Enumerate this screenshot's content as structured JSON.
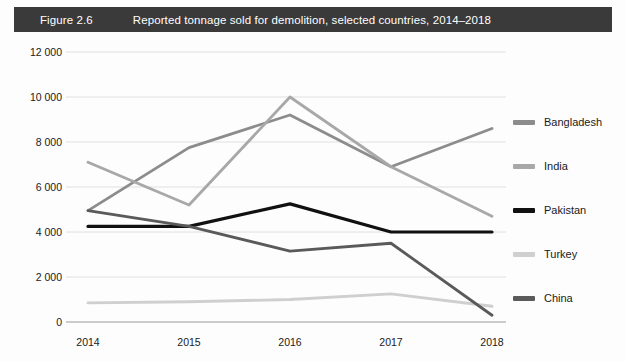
{
  "header": {
    "figure_number": "Figure 2.6",
    "title": "Reported tonnage sold for demolition, selected countries, 2014–2018",
    "banner_color": "#3a3a3a",
    "text_color": "#ffffff"
  },
  "chart_data": {
    "type": "line",
    "title": "Reported tonnage sold for demolition, selected countries, 2014–2018",
    "xlabel": "",
    "ylabel": "",
    "categories": [
      "2014",
      "2015",
      "2016",
      "2017",
      "2018"
    ],
    "x_tick_labels": [
      "2014",
      "2015",
      "2016",
      "2017",
      "2018"
    ],
    "y_tick_labels": [
      "12 000",
      "10 000",
      "8 000",
      "6 000",
      "4 000",
      "2 000",
      "0"
    ],
    "y_tick_values": [
      12000,
      10000,
      8000,
      6000,
      4000,
      2000,
      0
    ],
    "ylim": [
      0,
      12000
    ],
    "grid": true,
    "grid_axis": "y",
    "legend_position": "right",
    "series": [
      {
        "name": "Bangladesh",
        "color": "#8c8c8c",
        "values": [
          4950,
          7750,
          9200,
          6900,
          8600
        ]
      },
      {
        "name": "India",
        "color": "#a8a8a8",
        "values": [
          7100,
          5200,
          10000,
          6900,
          4700
        ]
      },
      {
        "name": "Pakistan",
        "color": "#111111",
        "values": [
          4250,
          4250,
          5250,
          4000,
          4000
        ]
      },
      {
        "name": "Turkey",
        "color": "#cfcfcf",
        "values": [
          850,
          900,
          1000,
          1250,
          700
        ]
      },
      {
        "name": "China",
        "color": "#5a5a5a",
        "values": [
          4950,
          4250,
          3150,
          3500,
          300
        ]
      }
    ]
  },
  "legend": {
    "items": [
      {
        "label": "Bangladesh",
        "color": "#8c8c8c"
      },
      {
        "label": "India",
        "color": "#a8a8a8"
      },
      {
        "label": "Pakistan",
        "color": "#111111"
      },
      {
        "label": "Turkey",
        "color": "#cfcfcf"
      },
      {
        "label": "China",
        "color": "#5a5a5a"
      }
    ]
  }
}
